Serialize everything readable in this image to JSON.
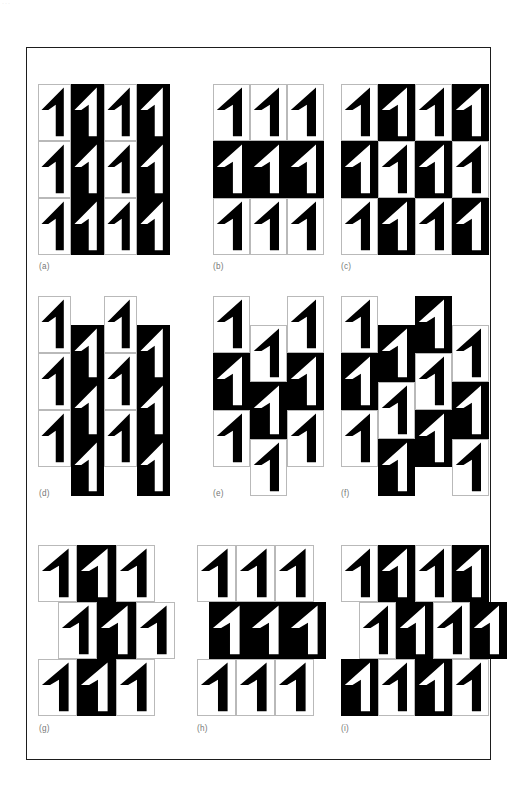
{
  "page": {
    "number_remnant": "···",
    "background_color": "#ffffff",
    "frame_color": "#1d1d1d",
    "ink_color": "#000000",
    "paper_color": "#ffffff",
    "cell_rule_color": "#b9b9b9",
    "label_color": "#777777"
  },
  "plate": {
    "frame": {
      "x": 26,
      "y": 47,
      "width": 465,
      "height": 713
    },
    "glyph": {
      "name": "numeral-one",
      "character": "1",
      "description": "stylized numeral one: triangular flag at top sloping down-right, vertical stem with foot"
    },
    "figure_count": 9
  },
  "figures": [
    {
      "id": "a",
      "label": "(a)",
      "origin": {
        "x": 38,
        "y": 84
      },
      "cell": {
        "w": 33,
        "h": 57
      },
      "cols": 4,
      "rows": 3,
      "col_offsets_y": [
        0,
        0,
        0,
        0
      ],
      "row_offsets_x": [
        0,
        0,
        0
      ],
      "scheme": "alternating-columns",
      "dark_map": [
        [
          0,
          1,
          0,
          1
        ],
        [
          0,
          1,
          0,
          1
        ],
        [
          0,
          1,
          0,
          1
        ]
      ],
      "label_pos": {
        "x": 39,
        "y": 262
      }
    },
    {
      "id": "b",
      "label": "(b)",
      "origin": {
        "x": 213,
        "y": 84
      },
      "cell": {
        "w": 37,
        "h": 57
      },
      "cols": 3,
      "rows": 3,
      "col_offsets_y": [
        0,
        0,
        0
      ],
      "row_offsets_x": [
        0,
        0,
        0
      ],
      "scheme": "alternating-rows",
      "dark_map": [
        [
          0,
          0,
          0
        ],
        [
          1,
          1,
          1
        ],
        [
          0,
          0,
          0
        ]
      ],
      "label_pos": {
        "x": 213,
        "y": 262
      }
    },
    {
      "id": "c",
      "label": "(c)",
      "origin": {
        "x": 341,
        "y": 84
      },
      "cell": {
        "w": 37,
        "h": 57
      },
      "cols": 4,
      "rows": 3,
      "col_offsets_y": [
        0,
        0,
        0,
        0
      ],
      "row_offsets_x": [
        0,
        0,
        0
      ],
      "scheme": "checkerboard",
      "dark_map": [
        [
          0,
          1,
          0,
          1
        ],
        [
          1,
          0,
          1,
          0
        ],
        [
          0,
          1,
          0,
          1
        ]
      ],
      "label_pos": {
        "x": 341,
        "y": 262
      }
    },
    {
      "id": "d",
      "label": "(d)",
      "origin": {
        "x": 38,
        "y": 296
      },
      "cell": {
        "w": 33,
        "h": 57
      },
      "cols": 4,
      "rows": 3,
      "col_offsets_y": [
        0,
        29,
        0,
        29
      ],
      "row_offsets_x": [
        0,
        0,
        0
      ],
      "scheme": "alternating-columns-half-drop",
      "dark_map": [
        [
          0,
          1,
          0,
          1
        ],
        [
          0,
          1,
          0,
          1
        ],
        [
          0,
          1,
          0,
          1
        ]
      ],
      "label_pos": {
        "x": 39,
        "y": 489
      }
    },
    {
      "id": "e",
      "label": "(e)",
      "origin": {
        "x": 213,
        "y": 296
      },
      "cell": {
        "w": 37,
        "h": 57
      },
      "cols": 3,
      "rows": 3,
      "col_offsets_y": [
        0,
        29,
        0
      ],
      "row_offsets_x": [
        0,
        0,
        0
      ],
      "scheme": "alternating-rows-half-drop-center-column",
      "dark_map": [
        [
          0,
          0,
          0
        ],
        [
          1,
          1,
          1
        ],
        [
          0,
          0,
          0
        ]
      ],
      "label_pos": {
        "x": 213,
        "y": 489
      }
    },
    {
      "id": "f",
      "label": "(f)",
      "origin": {
        "x": 341,
        "y": 296
      },
      "cell": {
        "w": 37,
        "h": 57
      },
      "cols": 4,
      "rows": 3,
      "col_offsets_y": [
        0,
        29,
        0,
        29
      ],
      "row_offsets_x": [
        0,
        0,
        0
      ],
      "scheme": "checkerboard-half-drop",
      "dark_map": [
        [
          0,
          1,
          1,
          0
        ],
        [
          1,
          0,
          0,
          1
        ],
        [
          0,
          1,
          1,
          0
        ]
      ],
      "label_pos": {
        "x": 341,
        "y": 489
      }
    },
    {
      "id": "g",
      "label": "(g)",
      "origin": {
        "x": 38,
        "y": 545
      },
      "cell": {
        "w": 39,
        "h": 57
      },
      "cols": 3,
      "rows": 3,
      "col_offsets_y": [
        0,
        0,
        0
      ],
      "row_offsets_x": [
        0,
        20,
        0
      ],
      "scheme": "alternating-columns-half-brick",
      "dark_map": [
        [
          0,
          1,
          0
        ],
        [
          0,
          1,
          0
        ],
        [
          0,
          1,
          0
        ]
      ],
      "label_pos": {
        "x": 39,
        "y": 724
      }
    },
    {
      "id": "h",
      "label": "(h)",
      "origin": {
        "x": 197,
        "y": 545
      },
      "cell": {
        "w": 39,
        "h": 57
      },
      "cols": 3,
      "rows": 3,
      "col_offsets_y": [
        0,
        0,
        0
      ],
      "row_offsets_x": [
        0,
        12,
        0
      ],
      "scheme": "alternating-rows-half-brick",
      "dark_map": [
        [
          0,
          0,
          0
        ],
        [
          1,
          1,
          1
        ],
        [
          0,
          0,
          0
        ]
      ],
      "label_pos": {
        "x": 197,
        "y": 724
      }
    },
    {
      "id": "i",
      "label": "(i)",
      "origin": {
        "x": 341,
        "y": 545
      },
      "cell": {
        "w": 37,
        "h": 57
      },
      "cols": 4,
      "rows": 3,
      "col_offsets_y": [
        0,
        0,
        0,
        0
      ],
      "row_offsets_x": [
        0,
        18,
        0
      ],
      "scheme": "checkerboard-half-brick",
      "dark_map": [
        [
          0,
          1,
          0,
          1
        ],
        [
          0,
          1,
          0,
          1
        ],
        [
          1,
          0,
          1,
          0
        ]
      ],
      "label_pos": {
        "x": 341,
        "y": 724
      }
    }
  ]
}
